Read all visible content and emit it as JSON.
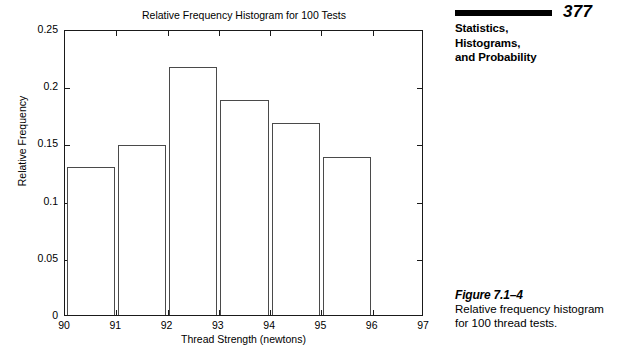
{
  "running_head": {
    "page_number": "377",
    "title_lines": [
      "Statistics,",
      "Histograms,",
      "and Probability"
    ]
  },
  "figure_caption": {
    "label": "Figure 7.1–4",
    "text": "Relative frequency histogram for 100 thread tests."
  },
  "chart_data": {
    "type": "bar",
    "title": "Relative Frequency Histogram for 100 Tests",
    "xlabel": "Thread Strength (newtons)",
    "ylabel": "Relative Frequency",
    "categories": [
      "90-91",
      "91-92",
      "92-93",
      "93-94",
      "94-95",
      "95-96"
    ],
    "bin_edges": [
      90,
      91,
      92,
      93,
      94,
      95,
      96
    ],
    "values": [
      0.129,
      0.149,
      0.217,
      0.188,
      0.168,
      0.138
    ],
    "xlim": [
      90,
      97
    ],
    "ylim": [
      0,
      0.25
    ],
    "xticks": [
      "90",
      "91",
      "92",
      "93",
      "94",
      "95",
      "96",
      "97"
    ],
    "xtick_values": [
      90,
      91,
      92,
      93,
      94,
      95,
      96,
      97
    ],
    "yticks": [
      "0",
      "0.05",
      "0.1",
      "0.15",
      "0.2",
      "0.25"
    ],
    "ytick_values": [
      0,
      0.05,
      0.1,
      0.15,
      0.2,
      0.25
    ],
    "grid": false,
    "legend": false,
    "bar_fill": "#ffffff",
    "bar_edge_color": "#4a4a4a",
    "axis_color": "#1a1a1a"
  }
}
